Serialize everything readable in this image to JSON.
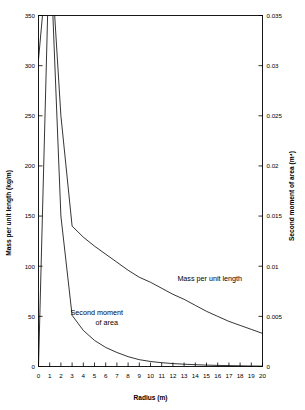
{
  "chart_data": {
    "type": "line",
    "title": "",
    "xlabel": "Radius (m)",
    "xlim": [
      0,
      20
    ],
    "xticks": [
      "0",
      "1",
      "2",
      "3",
      "4",
      "5",
      "6",
      "7",
      "8",
      "9",
      "10",
      "11",
      "12",
      "13",
      "14",
      "15",
      "16",
      "17",
      "18",
      "19",
      "20"
    ],
    "grid": false,
    "legend": "inline-annotations",
    "axes": [
      {
        "side": "left",
        "ylabel": "Mass per unit length (kg/m)",
        "ylim": [
          0,
          350
        ],
        "yticks": [
          "0",
          "50",
          "100",
          "150",
          "200",
          "250",
          "300",
          "350"
        ]
      },
      {
        "side": "right",
        "ylabel": "Second moment of area (m⁴)",
        "ylim": [
          0,
          0.035
        ],
        "yticks": [
          "0",
          "0.005",
          "0.01",
          "0.015",
          "0.02",
          "0.025",
          "0.03",
          "0.035"
        ]
      }
    ],
    "x": [
      0,
      1,
      2,
      3,
      4,
      5,
      6,
      7,
      8,
      9,
      10,
      11,
      12,
      13,
      14,
      15,
      16,
      17,
      18,
      19,
      20
    ],
    "series": [
      {
        "name": "Mass per unit length",
        "axis": "left",
        "units": "kg/m",
        "clipped_above_axis_max": true,
        "values": [
          306,
          430,
          250,
          140,
          129,
          120,
          112,
          104,
          96,
          89,
          84,
          78,
          72,
          67,
          61,
          55,
          50,
          45,
          41,
          37,
          33
        ]
      },
      {
        "name": "Second moment of area",
        "axis": "right",
        "units": "m^4",
        "clipped_above_axis_max": true,
        "values": [
          0.0,
          0.043,
          0.015,
          0.0051,
          0.0036,
          0.0026,
          0.0019,
          0.0014,
          0.00098,
          0.00068,
          0.0005,
          0.00038,
          0.00029,
          0.00023,
          0.00018,
          0.00014,
          0.00011,
          9e-05,
          7e-05,
          5e-05,
          4e-05
        ]
      }
    ],
    "annotations": [
      {
        "name": "mass-per-unit-length-label",
        "text": "Mass per unit length",
        "x": 12.4,
        "y_px": 281
      },
      {
        "name": "second-moment-label-line1",
        "text": "Second moment",
        "x": 5.2,
        "y_px": 315
      },
      {
        "name": "second-moment-label-line2",
        "text": "of area",
        "x": 6.1,
        "y_px": 325
      }
    ],
    "colors": {
      "line": "#000000",
      "frame": "#000000",
      "background": "#ffffff"
    }
  }
}
